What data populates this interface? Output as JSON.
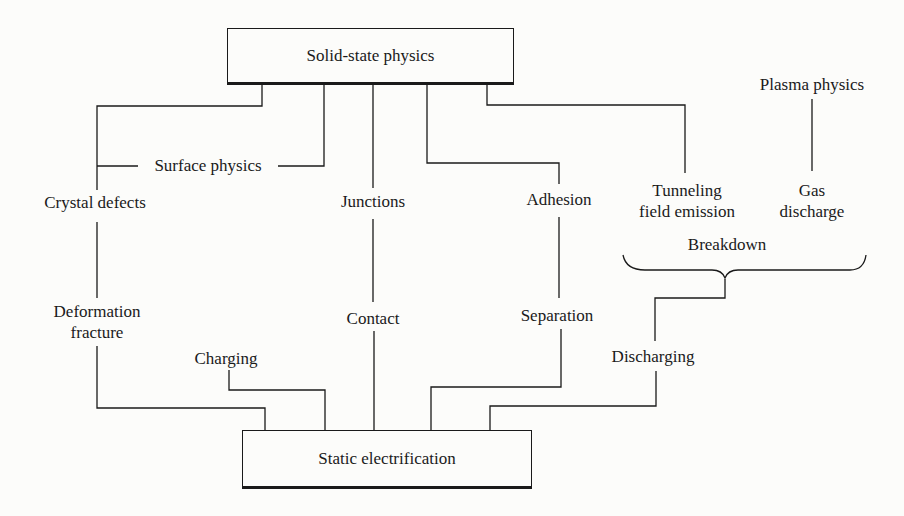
{
  "diagram": {
    "top_node": "Solid-state physics",
    "bottom_node": "Static electrification",
    "plasma_node": "Plasma physics",
    "labels": {
      "surface_physics": "Surface physics",
      "crystal_defects": "Crystal defects",
      "deformation_line1": "Deformation",
      "deformation_line2": "fracture",
      "charging": "Charging",
      "junctions": "Junctions",
      "contact": "Contact",
      "adhesion": "Adhesion",
      "separation": "Separation",
      "tunneling_line1": "Tunneling",
      "tunneling_line2": "field emission",
      "gas_line1": "Gas",
      "gas_line2": "discharge",
      "breakdown": "Breakdown",
      "discharging": "Discharging"
    },
    "edges": [
      [
        "Solid-state physics",
        "Crystal defects"
      ],
      [
        "Solid-state physics",
        "Surface physics"
      ],
      [
        "Solid-state physics",
        "Junctions"
      ],
      [
        "Solid-state physics",
        "Adhesion"
      ],
      [
        "Solid-state physics",
        "Tunneling field emission"
      ],
      [
        "Plasma physics",
        "Gas discharge"
      ],
      [
        "Crystal defects",
        "Deformation fracture"
      ],
      [
        "Junctions",
        "Contact"
      ],
      [
        "Adhesion",
        "Separation"
      ],
      [
        "Tunneling field emission",
        "Breakdown"
      ],
      [
        "Gas discharge",
        "Breakdown"
      ],
      [
        "Breakdown",
        "Discharging"
      ],
      [
        "Deformation fracture",
        "Static electrification"
      ],
      [
        "Charging",
        "Static electrification"
      ],
      [
        "Contact",
        "Static electrification"
      ],
      [
        "Separation",
        "Static electrification"
      ],
      [
        "Discharging",
        "Static electrification"
      ]
    ]
  }
}
